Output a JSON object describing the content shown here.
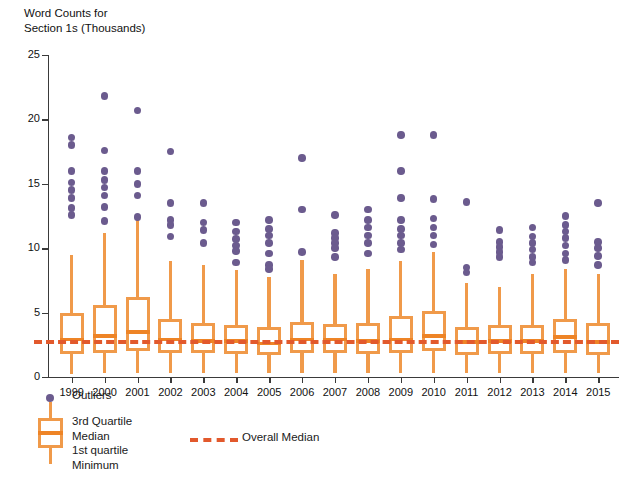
{
  "chart_data": {
    "type": "box",
    "title": "Word Counts for\nSection 1s (Thousands)",
    "xlabel": "",
    "ylabel": "",
    "ylim": [
      0,
      25
    ],
    "yticks": [
      0,
      5,
      10,
      15,
      20,
      25
    ],
    "grid": false,
    "legend_position": "below-axes-left",
    "overall_median": 2.85,
    "categories": [
      "1999",
      "2000",
      "2001",
      "2002",
      "2003",
      "2004",
      "2005",
      "2006",
      "2007",
      "2008",
      "2009",
      "2010",
      "2011",
      "2012",
      "2013",
      "2014",
      "2015"
    ],
    "boxes": [
      {
        "year": "1999",
        "min": 0.2,
        "q1": 1.8,
        "median": 2.9,
        "q3": 5.0,
        "max": 9.5,
        "outliers": [
          18.6,
          18.0,
          16.0,
          15.1,
          14.5,
          13.9,
          13.1,
          12.6
        ]
      },
      {
        "year": "2000",
        "min": 0.3,
        "q1": 1.9,
        "median": 3.2,
        "q3": 5.6,
        "max": 11.2,
        "outliers": [
          21.8,
          17.6,
          16.0,
          15.3,
          14.7,
          14.1,
          13.2,
          12.1
        ]
      },
      {
        "year": "2001",
        "min": 0.3,
        "q1": 2.0,
        "median": 3.5,
        "q3": 6.2,
        "max": 12.3,
        "outliers": [
          20.7,
          16.0,
          15.0,
          14.1,
          12.4
        ]
      },
      {
        "year": "2002",
        "min": 0.3,
        "q1": 1.9,
        "median": 2.9,
        "q3": 4.5,
        "max": 9.0,
        "outliers": [
          17.5,
          13.5,
          12.2,
          11.8,
          10.9
        ]
      },
      {
        "year": "2003",
        "min": 0.3,
        "q1": 1.9,
        "median": 2.8,
        "q3": 4.2,
        "max": 8.7,
        "outliers": [
          13.5,
          12.0,
          11.4,
          10.4
        ]
      },
      {
        "year": "2004",
        "min": 0.3,
        "q1": 1.8,
        "median": 2.8,
        "q3": 4.0,
        "max": 8.3,
        "outliers": [
          12.0,
          11.3,
          10.7,
          10.2,
          9.8,
          8.9
        ]
      },
      {
        "year": "2005",
        "min": 0.3,
        "q1": 1.7,
        "median": 2.6,
        "q3": 3.9,
        "max": 7.8,
        "outliers": [
          12.2,
          11.5,
          11.0,
          10.4,
          9.6,
          8.7,
          8.4
        ]
      },
      {
        "year": "2006",
        "min": 0.3,
        "q1": 1.9,
        "median": 2.9,
        "q3": 4.3,
        "max": 9.1,
        "outliers": [
          17.0,
          13.0,
          9.7
        ]
      },
      {
        "year": "2007",
        "min": 0.3,
        "q1": 1.9,
        "median": 2.9,
        "q3": 4.1,
        "max": 8.0,
        "outliers": [
          12.6,
          11.2,
          10.8,
          10.4,
          10.0,
          9.3
        ]
      },
      {
        "year": "2008",
        "min": 0.3,
        "q1": 1.8,
        "median": 2.8,
        "q3": 4.2,
        "max": 8.4,
        "outliers": [
          13.0,
          12.2,
          11.6,
          11.0,
          10.4,
          9.6
        ]
      },
      {
        "year": "2009",
        "min": 0.3,
        "q1": 1.9,
        "median": 2.9,
        "q3": 4.7,
        "max": 9.0,
        "outliers": [
          18.8,
          16.0,
          13.9,
          12.2,
          11.5,
          11.0,
          10.4,
          9.9
        ]
      },
      {
        "year": "2010",
        "min": 0.3,
        "q1": 2.0,
        "median": 3.2,
        "q3": 5.1,
        "max": 9.7,
        "outliers": [
          18.8,
          13.8,
          12.3,
          11.6,
          11.0,
          10.3
        ]
      },
      {
        "year": "2011",
        "min": 0.3,
        "q1": 1.7,
        "median": 2.7,
        "q3": 3.9,
        "max": 7.3,
        "outliers": [
          13.6,
          8.5,
          8.1
        ]
      },
      {
        "year": "2012",
        "min": 0.3,
        "q1": 1.8,
        "median": 2.8,
        "q3": 4.0,
        "max": 7.0,
        "outliers": [
          11.4,
          10.5,
          10.1,
          9.7,
          9.3
        ]
      },
      {
        "year": "2013",
        "min": 0.3,
        "q1": 1.8,
        "median": 2.8,
        "q3": 4.0,
        "max": 8.0,
        "outliers": [
          11.6,
          10.9,
          10.4,
          9.9,
          9.3,
          8.9
        ]
      },
      {
        "year": "2014",
        "min": 0.3,
        "q1": 1.9,
        "median": 3.1,
        "q3": 4.5,
        "max": 8.4,
        "outliers": [
          12.5,
          11.8,
          11.3,
          10.8,
          10.2,
          9.6,
          9.1
        ]
      },
      {
        "year": "2015",
        "min": 0.3,
        "q1": 1.7,
        "median": 2.7,
        "q3": 4.2,
        "max": 8.0,
        "outliers": [
          13.5,
          10.5,
          10.0,
          9.4,
          8.7
        ]
      }
    ]
  },
  "legend": {
    "outliers_label": "Outliers",
    "box_labels": "3rd Quartile\nMedian\n1st quartile\nMinimum",
    "overall_median_label": "Overall Median"
  },
  "colors": {
    "box": "#F09A4A",
    "median": "#EE8426",
    "outlier": "#6B5B8E",
    "overall_median": "#E2592C",
    "axis": "#3A3A3A",
    "text": "#111111",
    "background": "#FFFFFF"
  }
}
